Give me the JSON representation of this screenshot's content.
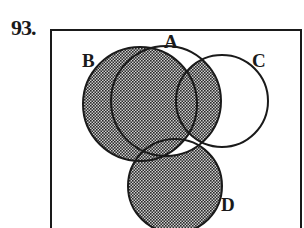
{
  "problem": {
    "number": "93."
  },
  "diagram": {
    "type": "venn",
    "sets": [
      {
        "name": "A",
        "label": "A",
        "cx": 166,
        "cy": 101,
        "r": 55
      },
      {
        "name": "B",
        "label": "B",
        "cx": 140,
        "cy": 104,
        "r": 57
      },
      {
        "name": "C",
        "label": "C",
        "cx": 222,
        "cy": 101,
        "r": 46
      },
      {
        "name": "D",
        "label": "D",
        "cx": 175,
        "cy": 186,
        "r": 47
      }
    ],
    "shaded_regions": [
      "B",
      "A ∩ C",
      "D − A"
    ],
    "colors": {
      "stroke": "#1a1a1a",
      "shade": "#555555",
      "background": "#ffffff"
    }
  }
}
